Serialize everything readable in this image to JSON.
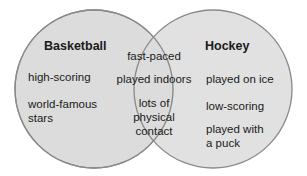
{
  "diagram": {
    "type": "venn",
    "colors": {
      "fill": "#dcdcdc",
      "stroke": "#8a8a8a",
      "text": "#1a1a1a"
    },
    "left_set": {
      "title": "Basketball",
      "items": [
        "high-scoring",
        "world-famous stars"
      ],
      "item_lines": [
        [
          "high-scoring"
        ],
        [
          "world-famous",
          "stars"
        ]
      ]
    },
    "right_set": {
      "title": "Hockey",
      "items": [
        "played on ice",
        "low-scoring",
        "played with a puck"
      ],
      "item_lines": [
        [
          "played on ice"
        ],
        [
          "low-scoring"
        ],
        [
          "played with",
          "a puck"
        ]
      ]
    },
    "intersection": {
      "items": [
        "fast-paced",
        "played indoors",
        "lots of physical contact"
      ],
      "item_lines": [
        [
          "fast-paced"
        ],
        [
          "played indoors"
        ],
        [
          "lots of",
          "physical",
          "contact"
        ]
      ]
    }
  }
}
